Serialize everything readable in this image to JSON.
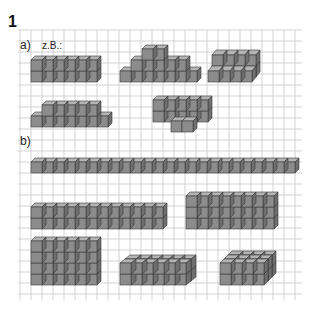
{
  "exercise": {
    "number": "1",
    "part_a_label": "a)",
    "example_label": "z.B.:",
    "part_b_label": "b)"
  },
  "colors": {
    "grid": "#c8c8c8",
    "cube_front": "#8c8c8c",
    "cube_top": "#b4b4b4",
    "cube_side": "#6e6e6e",
    "edge": "#3a3a3a"
  },
  "part_a_shapes": [
    {
      "name": "row-6x2",
      "description": "6 cubes wide, 2 high"
    },
    {
      "name": "pyramid",
      "description": "stepped: 7 bottom, 5 middle, 2 top"
    },
    {
      "name": "step-4",
      "description": "4 wide, 2 rows stepped back"
    },
    {
      "name": "row-with-ends",
      "description": "5 on top of 7 bottom"
    },
    {
      "name": "block-with-front",
      "description": "5x2 block with 2 cubes in front"
    }
  ],
  "part_b_shapes": [
    {
      "name": "bar-24",
      "description": "24 cubes in a row"
    },
    {
      "name": "wall-12x2",
      "description": "12 wide, 2 high"
    },
    {
      "name": "wall-8x3",
      "description": "8 wide, 3 high"
    },
    {
      "name": "wall-6x4",
      "description": "6 wide, 4 high"
    },
    {
      "name": "box-6x2x2",
      "description": "6 wide, 2 deep, 2 high"
    },
    {
      "name": "box-4x3x2",
      "description": "4 wide, 3 deep, 2 high"
    }
  ]
}
